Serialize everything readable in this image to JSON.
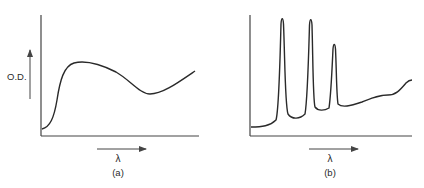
{
  "figure": {
    "panels": [
      {
        "id": "a",
        "caption": "(a)",
        "ylabel": "O.D.",
        "xlabel": "λ",
        "description": "Broad absorption spectrum: steep rise, broad maximum, shallow minimum, rising tail"
      },
      {
        "id": "b",
        "caption": "(b)",
        "ylabel": "",
        "xlabel": "λ",
        "description": "Sharp-line absorption spectrum: three narrow peaks of decreasing height followed by a gently rising structured background"
      }
    ],
    "colors": {
      "line": "#2a2a2a",
      "axis": "#444444",
      "background": "#ffffff"
    }
  }
}
